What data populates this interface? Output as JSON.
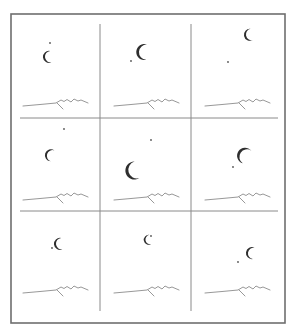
{
  "figure": {
    "width": 293,
    "height": 332,
    "colors": {
      "frame": "#6e6e6e",
      "grid": "#8a8a8a",
      "moon": "#2e2e2e",
      "star": "#555555",
      "horizon": "#8c8c8c",
      "background": "#ffffff"
    },
    "frame": {
      "x": 11,
      "y": 14,
      "w": 274,
      "h": 309
    },
    "grid": {
      "vertical": [
        {
          "x": 100,
          "y1": 24,
          "y2": 311
        },
        {
          "x": 191,
          "y1": 24,
          "y2": 311
        }
      ],
      "horizontal": [
        {
          "y": 118,
          "x1": 20,
          "x2": 278
        },
        {
          "y": 211,
          "x1": 20,
          "x2": 278
        }
      ]
    },
    "panels": [
      {
        "id": 1,
        "row": 0,
        "col": 0,
        "ox": 0,
        "oy": 0,
        "moon": {
          "cx": 48,
          "cy": 57,
          "r": 6,
          "angle": 0,
          "scale": 1.0
        },
        "star": {
          "x": 50,
          "y": 43
        }
      },
      {
        "id": 2,
        "row": 0,
        "col": 1,
        "ox": 91,
        "oy": 0,
        "moon": {
          "cx": 143,
          "cy": 52,
          "r": 8,
          "angle": 10,
          "scale": 1.25
        },
        "star": {
          "x": 131,
          "y": 61
        }
      },
      {
        "id": 3,
        "row": 0,
        "col": 2,
        "ox": 182,
        "oy": 0,
        "moon": {
          "cx": 249,
          "cy": 35,
          "r": 6,
          "angle": -5,
          "scale": 1.0
        },
        "star": {
          "x": 228,
          "y": 62
        }
      },
      {
        "id": 4,
        "row": 1,
        "col": 0,
        "ox": 0,
        "oy": 94,
        "moon": {
          "cx": 50,
          "cy": 155,
          "r": 6,
          "angle": 25,
          "scale": 1.0
        },
        "star": {
          "x": 64,
          "y": 129
        }
      },
      {
        "id": 5,
        "row": 1,
        "col": 1,
        "ox": 91,
        "oy": 94,
        "moon": {
          "cx": 133,
          "cy": 171,
          "r": 9,
          "angle": -10,
          "scale": 1.35
        },
        "star": {
          "x": 151,
          "y": 140
        }
      },
      {
        "id": 6,
        "row": 1,
        "col": 2,
        "ox": 182,
        "oy": 94,
        "moon": {
          "cx": 244,
          "cy": 155,
          "r": 8,
          "angle": 40,
          "scale": 1.25
        },
        "star": {
          "x": 233,
          "y": 167
        }
      },
      {
        "id": 7,
        "row": 2,
        "col": 0,
        "ox": 0,
        "oy": 187,
        "moon": {
          "cx": 59,
          "cy": 244,
          "r": 6,
          "angle": 0,
          "scale": 1.0
        },
        "star": {
          "x": 52,
          "y": 248
        }
      },
      {
        "id": 8,
        "row": 2,
        "col": 1,
        "ox": 91,
        "oy": 187,
        "moon": {
          "cx": 148,
          "cy": 240,
          "r": 5,
          "angle": -5,
          "scale": 0.9
        },
        "star": {
          "x": 151,
          "y": 236
        }
      },
      {
        "id": 9,
        "row": 2,
        "col": 2,
        "ox": 182,
        "oy": 187,
        "moon": {
          "cx": 251,
          "cy": 253,
          "r": 6,
          "angle": 15,
          "scale": 1.0
        },
        "star": {
          "x": 238,
          "y": 262
        }
      }
    ],
    "horizon_path": "M23,106 L40,104.5 L56,103 L61,100 L64,101.5 L67,99.5 L71,102 L74,99 L78,101 L81,100 L88,103",
    "horizon_ridge": "M57,103 L63,109"
  }
}
